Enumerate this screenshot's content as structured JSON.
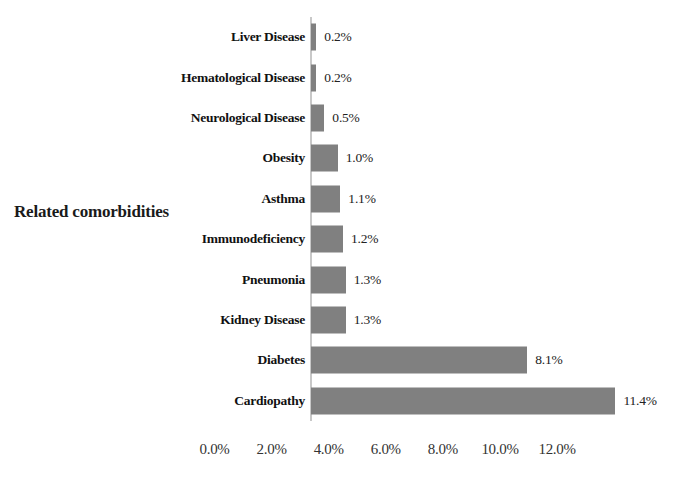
{
  "chart_data": {
    "type": "bar",
    "orientation": "horizontal",
    "title": "",
    "xlabel": "",
    "ylabel": "Related comorbidities",
    "categories": [
      "Liver Disease",
      "Hematological Disease",
      "Neurological Disease",
      "Obesity",
      "Asthma",
      "Immunodeficiency",
      "Pneumonia",
      "Kidney Disease",
      "Diabetes",
      "Cardiopathy"
    ],
    "values": [
      0.2,
      0.2,
      0.5,
      1.0,
      1.1,
      1.2,
      1.3,
      1.3,
      8.1,
      11.4
    ],
    "data_labels": [
      "0.2%",
      "0.2%",
      "0.5%",
      "1.0%",
      "1.1%",
      "1.2%",
      "1.3%",
      "1.3%",
      "8.1%",
      "11.4%"
    ],
    "xtick_labels": [
      "0.0%",
      "2.0%",
      "4.0%",
      "6.0%",
      "8.0%",
      "10.0%",
      "12.0%"
    ],
    "xtick_values": [
      0,
      2,
      4,
      6,
      8,
      10,
      12
    ],
    "xlim": [
      0,
      12
    ],
    "grid": false,
    "legend": null,
    "bar_color": "#808080",
    "background_color": "#ffffff",
    "axis_line_color": "#c8c8c8"
  },
  "axis": {
    "y_title": "Related comorbidities"
  }
}
